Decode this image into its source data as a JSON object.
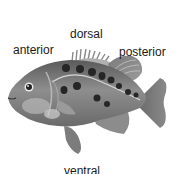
{
  "diagram": {
    "labels": {
      "dorsal": "dorsal",
      "anterior": "anterior",
      "posterior": "posterior",
      "ventral": "ventral"
    }
  },
  "colors": {
    "background": "#ffffff",
    "text": "#1a1a1a",
    "body_dark": "#4a4a4a",
    "body_mid": "#8a8a8a",
    "body_light": "#c8c8c8",
    "spots": "#222222"
  }
}
